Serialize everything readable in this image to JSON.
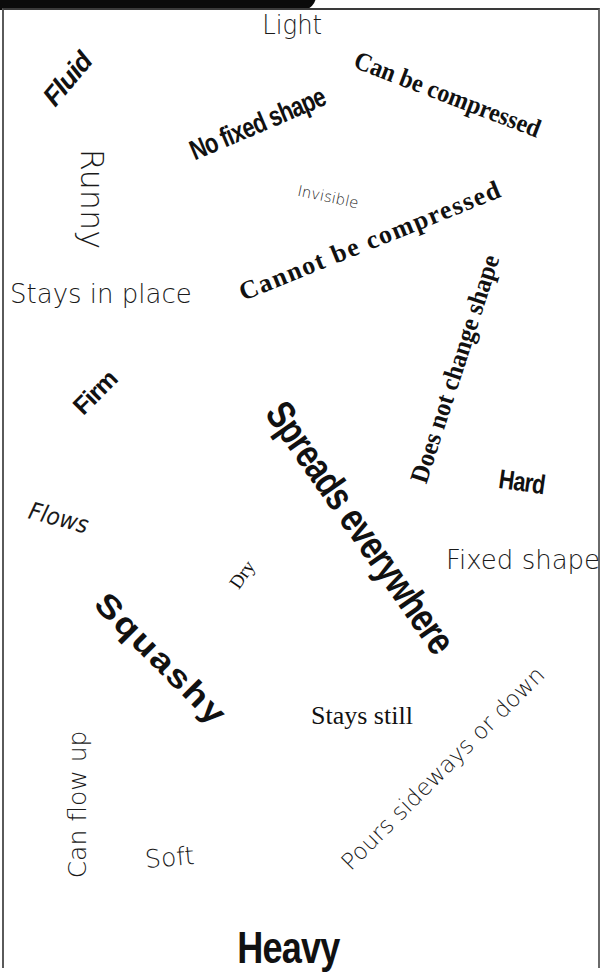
{
  "header_tab": {
    "label": "",
    "background": "#0b0b0b"
  },
  "words": {
    "light": "Light",
    "fluid": "Fluid",
    "can_be_compressed": "Can be compressed",
    "no_fixed_shape": "No fixed shape",
    "runny": "Runny",
    "invisible": "Invisible",
    "cannot_be_compressed": "Cannot be compressed",
    "stays_in_place": "Stays in place",
    "does_not_change_shape": "Does not change shape",
    "firm": "Firm",
    "spreads_everywhere": "Spreads everywhere",
    "hard": "Hard",
    "flows": "Flows",
    "fixed_shape": "Fixed shape",
    "dry": "Dry",
    "squashy": "Squashy",
    "stays_still": "Stays still",
    "pours_sideways_or_down": "Pours sideways or down",
    "can_flow_up": "Can flow up",
    "soft": "Soft",
    "heavy": "Heavy"
  },
  "colors": {
    "text": "#111111",
    "background": "#ffffff",
    "frame": "#3a3a3a"
  }
}
